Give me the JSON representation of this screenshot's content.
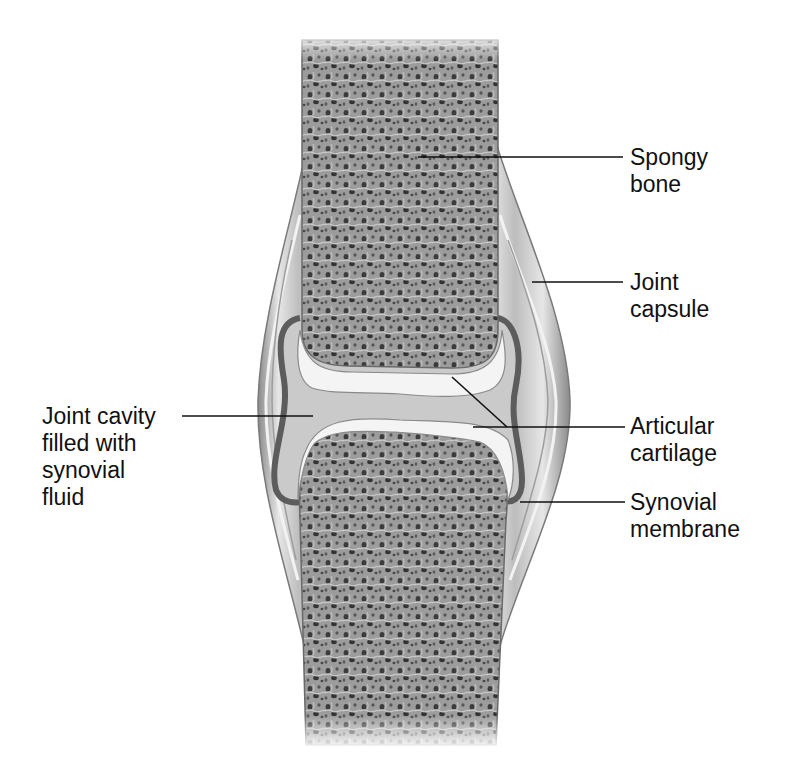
{
  "diagram": {
    "colors": {
      "background": "#ffffff",
      "bone_fill": "#9a9a9a",
      "bone_pores": "#3a3a3a",
      "cartilage": "#f4f4f4",
      "cavity_fluid": "#c9c9c9",
      "synovial_membrane": "#5c5c5c",
      "capsule": "#d4d4d4",
      "capsule_edge": "#7a7a7a",
      "leader_line": "#111111"
    },
    "labels": [
      {
        "id": "spongy-bone",
        "lines": [
          "Spongy",
          "bone"
        ]
      },
      {
        "id": "joint-capsule",
        "lines": [
          "Joint",
          "capsule"
        ]
      },
      {
        "id": "joint-cavity",
        "lines": [
          "Joint cavity",
          "filled with",
          "synovial",
          "fluid"
        ]
      },
      {
        "id": "articular-cartilage",
        "lines": [
          "Articular",
          "cartilage"
        ]
      },
      {
        "id": "synovial-membrane",
        "lines": [
          "Synovial",
          "membrane"
        ]
      }
    ]
  }
}
